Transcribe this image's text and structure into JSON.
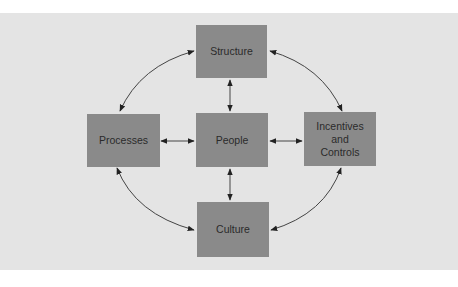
{
  "diagram": {
    "colors": {
      "background": "#e4e4e4",
      "box_fill": "#8a8a8a",
      "text": "#2a2a2a",
      "arrow": "#333333"
    },
    "nodes": {
      "structure": {
        "label": "Structure"
      },
      "processes": {
        "label": "Processes"
      },
      "people": {
        "label": "People"
      },
      "incentives": {
        "label": "Incentives\nand\nControls"
      },
      "culture": {
        "label": "Culture"
      }
    },
    "edges": [
      {
        "from": "Structure",
        "to": "People",
        "type": "bidirectional"
      },
      {
        "from": "Processes",
        "to": "People",
        "type": "bidirectional"
      },
      {
        "from": "People",
        "to": "Incentives and Controls",
        "type": "bidirectional"
      },
      {
        "from": "People",
        "to": "Culture",
        "type": "bidirectional"
      },
      {
        "from": "Structure",
        "to": "Processes",
        "type": "bidirectional-curved"
      },
      {
        "from": "Structure",
        "to": "Incentives and Controls",
        "type": "bidirectional-curved"
      },
      {
        "from": "Processes",
        "to": "Culture",
        "type": "bidirectional-curved"
      },
      {
        "from": "Incentives and Controls",
        "to": "Culture",
        "type": "bidirectional-curved"
      }
    ]
  }
}
